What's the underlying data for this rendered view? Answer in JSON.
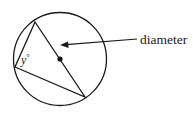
{
  "diagram": {
    "circle": {
      "cx": 60,
      "cy": 59,
      "r": 46.5,
      "stroke": "#1a1a1a"
    },
    "center_point": {
      "x": 60,
      "y": 59
    },
    "triangle": {
      "vertices": [
        {
          "name": "top",
          "x": 35,
          "y": 22
        },
        {
          "name": "left",
          "x": 15,
          "y": 67
        },
        {
          "name": "bottom-right",
          "x": 85,
          "y": 97
        }
      ]
    },
    "angle_label": {
      "variable": "y",
      "unit": "°",
      "text": "y°"
    },
    "callout": {
      "label": "diameter",
      "arrow_from": {
        "x": 137,
        "y": 39
      },
      "arrow_to": {
        "x": 61,
        "y": 45
      }
    }
  }
}
